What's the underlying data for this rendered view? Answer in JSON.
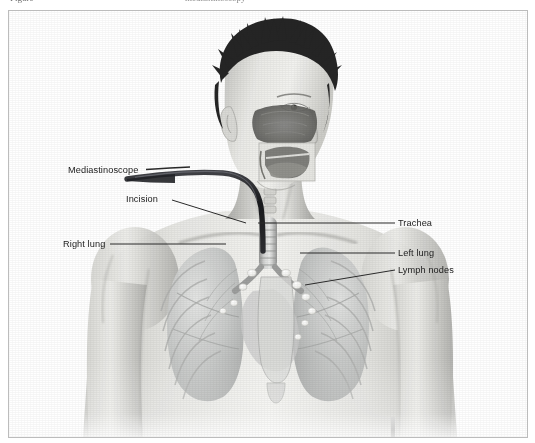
{
  "caption": {
    "leading_text": "Figure",
    "trailing_text": "mediastinoscopy"
  },
  "figure": {
    "view": "anterior three-quarter",
    "rendering": "grayscale airbrush medical illustration"
  },
  "labels": [
    {
      "id": "mediastinoscope",
      "text": "Mediastinoscope",
      "side": "left",
      "target": "scope tube entering neck"
    },
    {
      "id": "incision",
      "text": "Incision",
      "side": "left",
      "target": "suprasternal notch incision"
    },
    {
      "id": "right_lung",
      "text": "Right lung",
      "side": "left",
      "target": "patient right lung"
    },
    {
      "id": "trachea",
      "text": "Trachea",
      "side": "right",
      "target": "trachea / airway"
    },
    {
      "id": "left_lung",
      "text": "Left lung",
      "side": "right",
      "target": "patient left lung"
    },
    {
      "id": "lymph_nodes",
      "text": "Lymph nodes",
      "side": "right",
      "target": "mediastinal lymph nodes"
    }
  ],
  "colors": {
    "frame_border": "#bcbcbc",
    "label_text": "#1b1b1b",
    "leader_line": "#2a2a2a",
    "scope_tube": "#15161a",
    "skin_light": "#ededea",
    "skin_mid": "#cfcfcb",
    "skin_shadow": "#a6a6a3",
    "hair_dark": "#1d1d1d",
    "lung_tone": "#b9bbba",
    "lymph_node": "#f4f4f2",
    "background": "#ffffff"
  },
  "anatomy_structures": [
    "hair",
    "face",
    "ear",
    "nasal cavity cutaway",
    "oral cavity cutaway",
    "tongue",
    "neck",
    "cervical spine",
    "clavicle",
    "sternum",
    "trachea",
    "main bronchi",
    "right lung",
    "left lung",
    "rib cage",
    "mediastinal lymph nodes",
    "shoulder",
    "upper arm",
    "thorax"
  ]
}
